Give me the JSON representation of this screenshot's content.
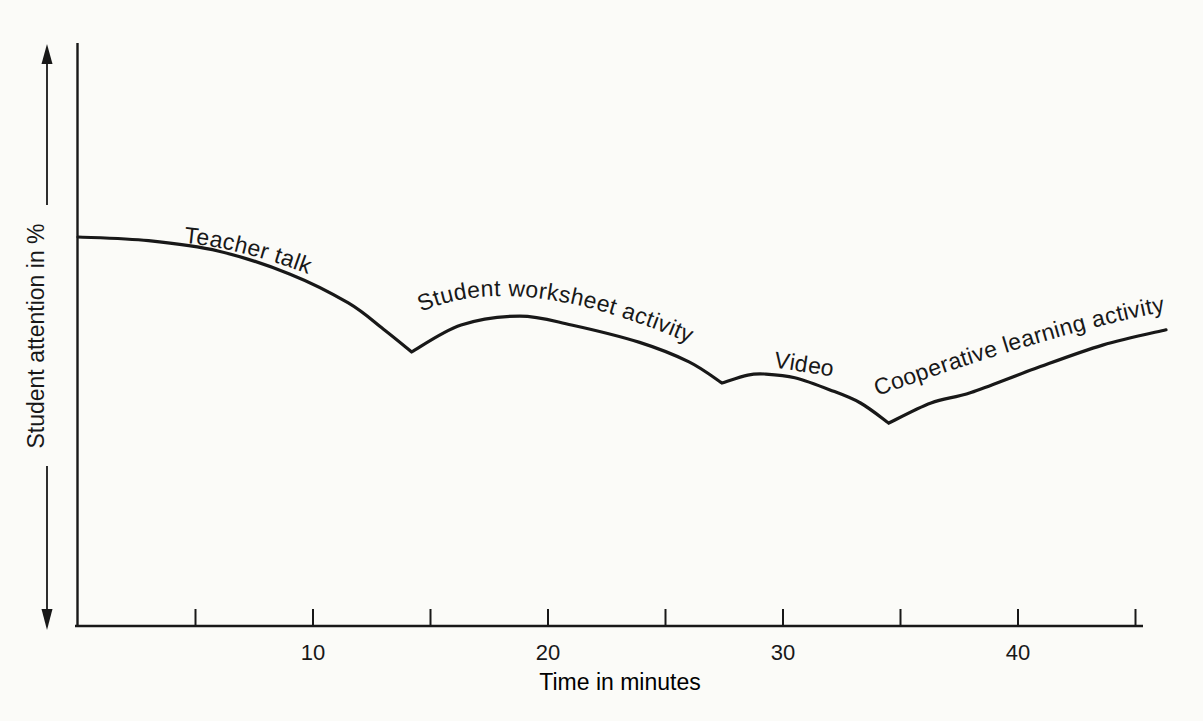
{
  "figure": {
    "background": "#fbfbf8",
    "ink_color": "#181818"
  },
  "chart_data": {
    "type": "line",
    "title": "",
    "xlabel": "Time in minutes",
    "ylabel": "Student attention in %",
    "x_major_ticks": [
      10,
      20,
      30,
      40
    ],
    "x_minor_ticks": [
      5,
      15,
      25,
      35,
      45
    ],
    "x_range_minutes": [
      0,
      46.3
    ],
    "y_axis_style": "unlabeled percentage scale with up and down arrows",
    "grid": false,
    "legend": "none",
    "segments": [
      {
        "label": "Teacher talk",
        "time_range_minutes": [
          0,
          14.2
        ],
        "points": [
          [
            0,
            74
          ],
          [
            3,
            73.3
          ],
          [
            6,
            71.3
          ],
          [
            9,
            67
          ],
          [
            11.5,
            61.5
          ],
          [
            13,
            56.5
          ],
          [
            14.2,
            52.2
          ]
        ],
        "label_path": [
          [
            4.5,
            72.9
          ],
          [
            7.3,
            71.8
          ],
          [
            11.2,
            64.5
          ]
        ]
      },
      {
        "label": "Student worksheet activity",
        "time_range_minutes": [
          14.2,
          27.4
        ],
        "points": [
          [
            14.2,
            52.2
          ],
          [
            16.3,
            57.3
          ],
          [
            18.8,
            59
          ],
          [
            21,
            57.3
          ],
          [
            23.9,
            54
          ],
          [
            26,
            50.3
          ],
          [
            27.4,
            46.3
          ]
        ],
        "label_path": [
          [
            14.6,
            59.8
          ],
          [
            19.4,
            69.3
          ],
          [
            28.4,
            48.8
          ]
        ]
      },
      {
        "label": "Video",
        "time_range_minutes": [
          27.4,
          34.5
        ],
        "points": [
          [
            27.4,
            46.3
          ],
          [
            28.5,
            47.8
          ],
          [
            29.2,
            48
          ],
          [
            30.5,
            47.3
          ],
          [
            32,
            45
          ],
          [
            33.3,
            42.5
          ],
          [
            34.5,
            38.7
          ]
        ],
        "label_path": [
          [
            29.6,
            49.3
          ],
          [
            31.0,
            48.3
          ],
          [
            33.5,
            46.6
          ]
        ]
      },
      {
        "label": "Cooperative learning activity",
        "time_range_minutes": [
          34.5,
          46.3
        ],
        "points": [
          [
            34.5,
            38.7
          ],
          [
            36.3,
            42.5
          ],
          [
            38,
            44.5
          ],
          [
            40.7,
            49
          ],
          [
            43.6,
            53.5
          ],
          [
            46.3,
            56.4
          ]
        ],
        "label_path": [
          [
            34.0,
            43.8
          ],
          [
            42.8,
            57.9
          ],
          [
            47.9,
            61.1
          ]
        ]
      }
    ]
  }
}
